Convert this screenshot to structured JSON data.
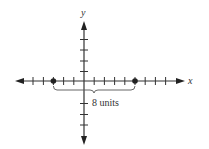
{
  "diagram": {
    "type": "coordinate-plane",
    "x_axis_label": "x",
    "y_axis_label": "y",
    "origin_px": [
      84,
      81
    ],
    "unit_px": 10.2,
    "x_ticks": [
      -6,
      -5,
      -4,
      -3,
      -2,
      -1,
      1,
      2,
      3,
      4,
      5,
      6,
      7,
      8
    ],
    "y_ticks": [
      -4,
      -3,
      -2,
      1,
      2,
      3,
      4
    ],
    "points": [
      {
        "x": -3,
        "y": 0
      },
      {
        "x": 5,
        "y": 0
      }
    ],
    "brace_label": "8 units",
    "colors": {
      "axis": "#333333",
      "point": "#222222",
      "background": "#ffffff"
    }
  }
}
